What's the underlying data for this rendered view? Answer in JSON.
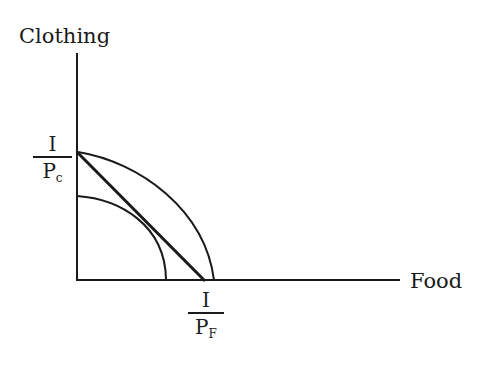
{
  "diagram": {
    "y_axis_label": "Clothing",
    "x_axis_label": "Food",
    "y_intercept_label": {
      "numerator": "I",
      "denominator_base": "P",
      "denominator_sub": "c"
    },
    "x_intercept_label": {
      "numerator": "I",
      "denominator_base": "P",
      "denominator_sub": "F"
    },
    "elements": [
      {
        "name": "budget-line",
        "type": "straight line",
        "from": "I/Pc on clothing axis",
        "to": "I/PF on food axis"
      },
      {
        "name": "outer-ppf-curve",
        "type": "concave curve",
        "from": "I/Pc on clothing axis",
        "to": "just beyond I/PF on food axis"
      },
      {
        "name": "inner-ppf-curve",
        "type": "concave curve",
        "note": "tangent to budget line"
      }
    ],
    "colors": {
      "line": "#1a1a1a",
      "background": "#ffffff"
    }
  }
}
